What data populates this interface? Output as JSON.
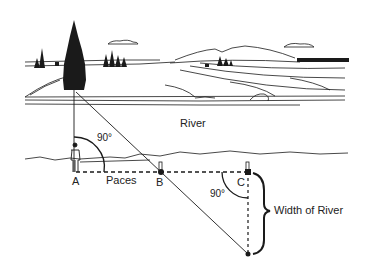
{
  "diagram": {
    "labels": {
      "river": "River",
      "angle_top": "90°",
      "point_a": "A",
      "paces": "Paces",
      "point_b": "B",
      "point_c": "C",
      "angle_c": "90°",
      "width": "Width of River"
    },
    "colors": {
      "ink": "#1a1a1a",
      "background": "#ffffff"
    }
  }
}
